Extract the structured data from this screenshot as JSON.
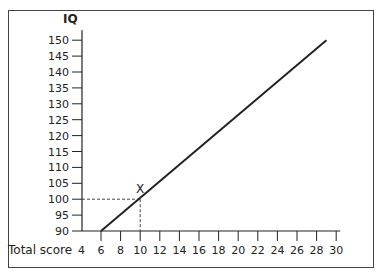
{
  "chart_data": {
    "type": "line",
    "title": "",
    "ylabel": "IQ",
    "xlabel": "Total score",
    "xlim": [
      4,
      30
    ],
    "ylim": [
      90,
      150
    ],
    "x_ticks": [
      4,
      6,
      8,
      10,
      12,
      14,
      16,
      18,
      20,
      22,
      24,
      26,
      28,
      30
    ],
    "y_ticks": [
      90,
      95,
      100,
      105,
      110,
      115,
      120,
      125,
      130,
      135,
      140,
      145,
      150
    ],
    "grid": false,
    "legend": null,
    "series": [
      {
        "name": "Conversion line",
        "x": [
          6,
          29
        ],
        "y": [
          90,
          150
        ],
        "color": "#222222"
      }
    ],
    "annotations": [
      {
        "label": "X",
        "x": 10,
        "y": 100,
        "style": "dashed guide lines to both axes"
      }
    ]
  },
  "labels": {
    "y_axis_title": "IQ",
    "x_axis_title": "Total score",
    "marker": "X"
  }
}
